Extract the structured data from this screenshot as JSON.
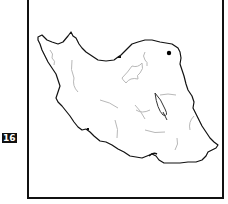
{
  "figure": {
    "type": "outline-map",
    "region": "Iran",
    "side_label": "16",
    "colors": {
      "border": "#111111",
      "rivers_lakes": "#b8b8b8",
      "frame": "#111111",
      "marker": "#000000"
    },
    "markers": [
      {
        "name": "city-point-northeast",
        "x": 169,
        "y": 53
      }
    ]
  }
}
